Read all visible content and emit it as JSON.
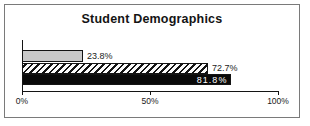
{
  "chart_data": {
    "type": "bar",
    "orientation": "horizontal",
    "title": "Student Demographics",
    "xlabel": "",
    "ylabel": "",
    "xlim": [
      0,
      100
    ],
    "grid": false,
    "legend": false,
    "bars": [
      {
        "value": 23.8,
        "label": "23.8%",
        "pattern": "solid",
        "fill_color": "#c9c9c9",
        "label_position": "outside-right",
        "label_color": "#1a1a1a"
      },
      {
        "value": 72.7,
        "label": "72.7%",
        "pattern": "diagonal-stripes",
        "fill_color": "#fbfbfb",
        "label_position": "outside-right",
        "label_color": "#1a1a1a"
      },
      {
        "value": 81.8,
        "label": "81.8%",
        "pattern": "solid",
        "fill_color": "#0a0a0a",
        "label_position": "inside-right",
        "label_color": "#ffffff"
      }
    ],
    "x_ticks": [
      {
        "label": "0%",
        "value": 0
      },
      {
        "label": "50%",
        "value": 50
      },
      {
        "label": "100%",
        "value": 100
      }
    ]
  },
  "colors": {
    "frame_border": "#7a7a7a",
    "axis": "#141414",
    "background": "#ffffff",
    "text": "#1a1a1a"
  }
}
